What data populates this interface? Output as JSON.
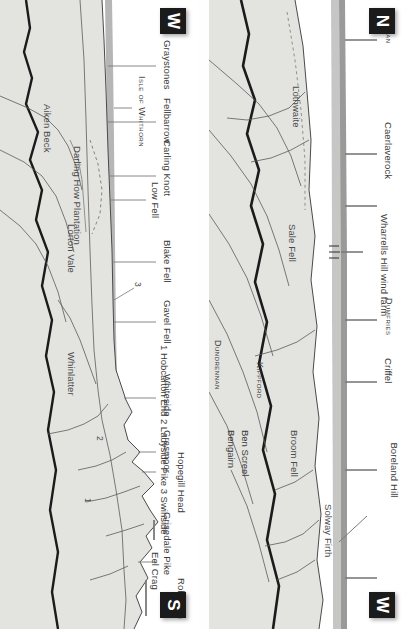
{
  "page": {
    "edge_caption": "A PANORAMA",
    "type": "panorama-skyline-diagram"
  },
  "key_caption": "1 Hobcarton End  2 Ladyside Pike  3 Swinside",
  "panel_top": {
    "name": "lake-district-panorama",
    "compass_start": "W",
    "compass_end": "S",
    "summit_labels": [
      "Graystones",
      "Fellbarrow",
      "Carling Knott",
      "Low Fell",
      "Blake Fell",
      "Gavel Fell",
      "Whiteside",
      "Grasmoor",
      "Hopegill Head",
      "Grisedale Pike",
      "Eel Crag",
      "Robinson"
    ],
    "smallcaps_labels": [
      "Isle of Whithorn"
    ],
    "interior_labels": [
      "Darling How Plantation",
      "Aiken Beck",
      "Lorton Vale",
      "Whinlatter"
    ],
    "numbered_markers": [
      "1",
      "2",
      "3"
    ]
  },
  "panel_bottom": {
    "name": "solway-scotland-panorama",
    "compass_start": "N",
    "compass_end": "W",
    "summit_labels": [
      "Annan",
      "Caerlaverock",
      "Wharrells Hill wind farm",
      "Dumfries",
      "Criffel",
      "Boreland Hill",
      "Kippford",
      "Ben Screel",
      "Bengairn"
    ],
    "smallcaps_labels": [
      "Annan",
      "Dumfries",
      "Kippford",
      "Dundrennan"
    ],
    "interior_labels": [
      "Lothwaite",
      "Sale Fell",
      "Broom Fell",
      "Solway Firth"
    ]
  },
  "colors": {
    "hill_fill": "#e3e3e0",
    "far_band": "#b6b6b6",
    "ink": "#2b2b2b",
    "marker_bg": "#1b1b1b",
    "marker_fg": "#ffffff"
  }
}
